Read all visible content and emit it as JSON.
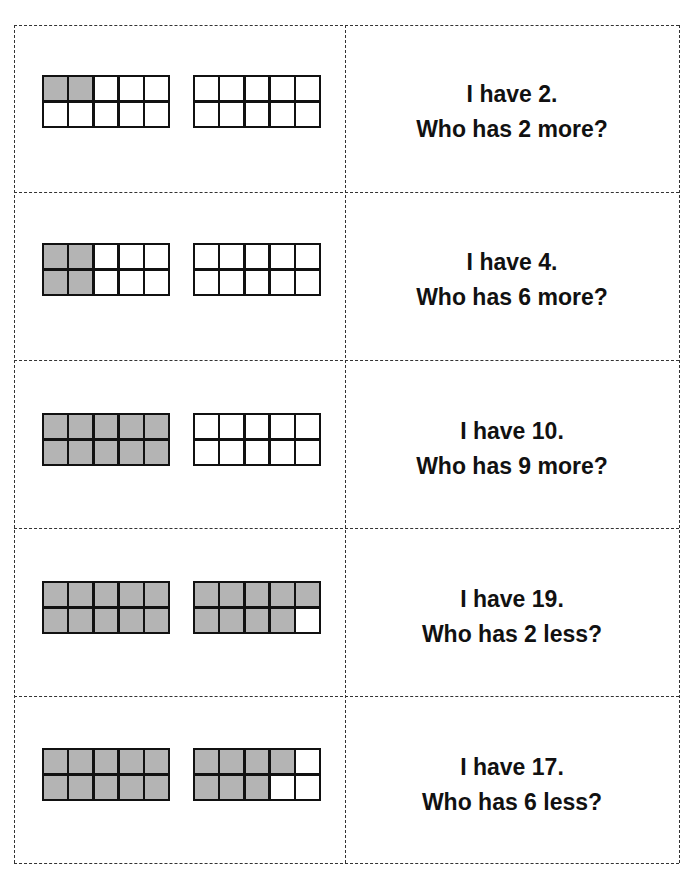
{
  "document": {
    "type": "I have / Who has ten-frame cards",
    "fill_color": "#b4b4b4",
    "cards": [
      {
        "have_text": "I have 2.",
        "who_text": "Who has 2 more?",
        "value": 2,
        "frame1": [
          1,
          1,
          0,
          0,
          0,
          0,
          0,
          0,
          0,
          0
        ],
        "frame2": [
          0,
          0,
          0,
          0,
          0,
          0,
          0,
          0,
          0,
          0
        ]
      },
      {
        "have_text": "I have 4.",
        "who_text": "Who has 6 more?",
        "value": 4,
        "frame1": [
          1,
          1,
          0,
          0,
          0,
          1,
          1,
          0,
          0,
          0
        ],
        "frame2": [
          0,
          0,
          0,
          0,
          0,
          0,
          0,
          0,
          0,
          0
        ]
      },
      {
        "have_text": "I have 10.",
        "who_text": "Who has 9 more?",
        "value": 10,
        "frame1": [
          1,
          1,
          1,
          1,
          1,
          1,
          1,
          1,
          1,
          1
        ],
        "frame2": [
          0,
          0,
          0,
          0,
          0,
          0,
          0,
          0,
          0,
          0
        ]
      },
      {
        "have_text": "I have 19.",
        "who_text": "Who has 2 less?",
        "value": 19,
        "frame1": [
          1,
          1,
          1,
          1,
          1,
          1,
          1,
          1,
          1,
          1
        ],
        "frame2": [
          1,
          1,
          1,
          1,
          1,
          1,
          1,
          1,
          1,
          0
        ]
      },
      {
        "have_text": "I have 17.",
        "who_text": "Who has 6 less?",
        "value": 17,
        "frame1": [
          1,
          1,
          1,
          1,
          1,
          1,
          1,
          1,
          1,
          1
        ],
        "frame2": [
          1,
          1,
          1,
          1,
          0,
          1,
          1,
          1,
          0,
          0
        ]
      }
    ]
  }
}
